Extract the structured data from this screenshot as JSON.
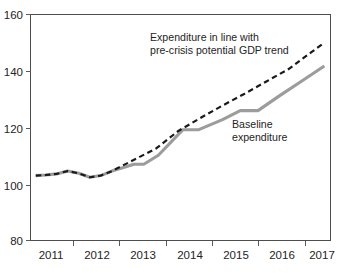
{
  "chart_data": {
    "type": "line",
    "title": "",
    "subtitle": "",
    "xlabel": "",
    "ylabel": "",
    "xlim": [
      2010.65,
      2017.45
    ],
    "ylim": [
      80,
      160
    ],
    "yticks": [
      80,
      100,
      120,
      140,
      160
    ],
    "ytick_labels": [
      "80",
      "100",
      "120",
      "140",
      "160"
    ],
    "xticks": [
      2011,
      2012,
      2013,
      2014,
      2015,
      2016,
      2017
    ],
    "xtick_labels": [
      "2011",
      "2012",
      "2013",
      "2014",
      "2015",
      "2016",
      "2017"
    ],
    "x_minor_ticks": [
      2011.5,
      2012.5,
      2013.5,
      2014.5,
      2015.5,
      2016.5
    ],
    "grid": false,
    "legend_position": "inline-annotation",
    "series": [
      {
        "name": "Expenditure in line with pre-crisis potential GDP trend",
        "style": "dashed",
        "color": "#1a1a1a",
        "x": [
          2010.78,
          2011.0,
          2011.25,
          2011.5,
          2011.75,
          2012.0,
          2012.25,
          2012.5,
          2013.0,
          2013.5,
          2014.0,
          2014.5,
          2015.0,
          2015.5,
          2016.0,
          2016.5,
          2017.0,
          2017.3
        ],
        "values": [
          102.8,
          103.0,
          103.4,
          104.4,
          103.6,
          102.2,
          102.8,
          104.4,
          108.4,
          112.4,
          118.6,
          123.2,
          127.6,
          131.8,
          136.2,
          140.6,
          146.4,
          149.8
        ]
      },
      {
        "name": "Baseline expenditure",
        "style": "solid",
        "color": "#9c9c9c",
        "x": [
          2010.78,
          2011.0,
          2011.25,
          2011.5,
          2011.75,
          2012.0,
          2012.25,
          2012.5,
          2013.0,
          2013.22,
          2013.55,
          2014.1,
          2014.45,
          2015.0,
          2015.4,
          2015.8,
          2016.3,
          2016.8,
          2017.3
        ],
        "values": [
          102.8,
          103.0,
          103.4,
          104.4,
          103.6,
          102.2,
          102.8,
          104.4,
          106.8,
          106.8,
          110.0,
          119.0,
          119.0,
          122.6,
          125.8,
          125.8,
          131.2,
          136.4,
          141.6
        ]
      }
    ],
    "annotations": [
      {
        "id": "trend-annotation",
        "lines": [
          "Expenditure in line with",
          "pre-crisis potential GDP trend"
        ],
        "x": 150,
        "y": 41
      },
      {
        "id": "baseline-annotation",
        "lines": [
          "Baseline",
          "expenditure"
        ],
        "x": 232,
        "y": 128
      }
    ]
  },
  "colors": {
    "baseline": "#9c9c9c",
    "trend": "#1a1a1a",
    "axis": "#4d4d4d",
    "text": "#242424",
    "background": "#ffffff"
  },
  "axis": {
    "y_labels": {
      "t160": "160",
      "t140": "140",
      "t120": "120",
      "t100": "100",
      "t80": "80"
    },
    "x_labels": {
      "y2011": "2011",
      "y2012": "2012",
      "y2013": "2013",
      "y2014": "2014",
      "y2015": "2015",
      "y2016": "2016",
      "y2017": "2017"
    }
  },
  "annotation_text": {
    "trend_line1": "Expenditure in line with",
    "trend_line2": "pre-crisis potential GDP trend",
    "baseline_line1": "Baseline",
    "baseline_line2": "expenditure"
  }
}
